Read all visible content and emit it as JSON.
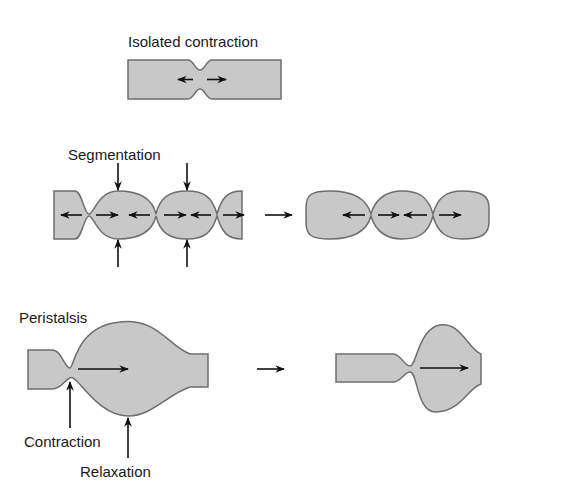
{
  "figure": {
    "colors": {
      "tube_fill": "#c8c8c8",
      "tube_stroke": "#6e6e6e",
      "arrow": "#111111",
      "text": "#1a1a1a",
      "background": "#ffffff"
    },
    "panels": [
      {
        "id": "isolated",
        "title": "Isolated contraction"
      },
      {
        "id": "segmentation",
        "title": "Segmentation"
      },
      {
        "id": "peristalsis",
        "title": "Peristalsis",
        "annotations": [
          "Contraction",
          "Relaxation"
        ]
      }
    ]
  }
}
